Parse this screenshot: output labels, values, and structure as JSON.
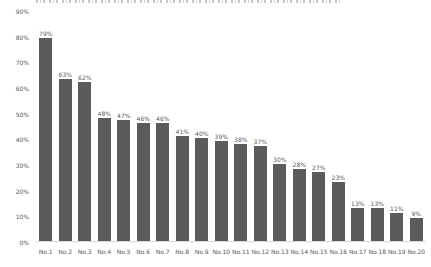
{
  "chart_data": {
    "type": "bar",
    "title": "",
    "unit": "%",
    "categories": [
      "No.1",
      "No.2",
      "No.3",
      "No.4",
      "No.5",
      "No.6",
      "No.7",
      "No.8",
      "No.9",
      "No.10",
      "No.11",
      "No.12",
      "No.13",
      "No.14",
      "No.15",
      "No.16",
      "No.17",
      "No.18",
      "No.19",
      "No.20"
    ],
    "values": [
      79,
      63,
      62,
      48,
      47,
      46,
      46,
      41,
      40,
      39,
      38,
      37,
      30,
      28,
      27,
      23,
      13,
      13,
      11,
      9
    ],
    "ytick_labels": [
      "0%",
      "10%",
      "20%",
      "30%",
      "40%",
      "50%",
      "60%",
      "70%",
      "80%",
      "90%"
    ],
    "ylim": [
      0,
      90
    ],
    "xlabel": "",
    "ylabel": "",
    "grid": false,
    "legend": "none",
    "bar_color": "#5b5b5b",
    "text_color": "#595959",
    "axis_line_color": "#d9d9d9"
  }
}
